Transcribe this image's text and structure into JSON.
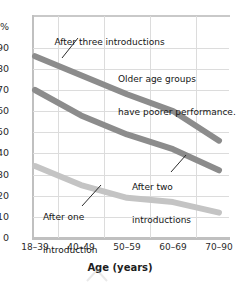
{
  "chart_data": {
    "type": "line",
    "title": "",
    "xlabel": "Age (years)",
    "ylabel": "",
    "categories": [
      "18–39",
      "40–49",
      "50–59",
      "60–69",
      "70–90"
    ],
    "series": [
      {
        "name": "After three introductions",
        "values": [
          86,
          77,
          68,
          60,
          46
        ],
        "color": "#8c8c8c"
      },
      {
        "name": "After two introductions",
        "values": [
          70,
          58,
          49,
          42,
          32
        ],
        "color": "#8c8c8c"
      },
      {
        "name": "After one introduction",
        "values": [
          34,
          25,
          19,
          17,
          12
        ],
        "color": "#c4c4c4"
      }
    ],
    "ylim": [
      0,
      105
    ],
    "yticks": [
      "100%",
      "90",
      "80",
      "70",
      "60",
      "50",
      "40",
      "30",
      "20",
      "10",
      "0"
    ],
    "ytick_values": [
      100,
      90,
      80,
      70,
      60,
      50,
      40,
      30,
      20,
      10,
      0
    ],
    "grid": true,
    "legend_position": "none",
    "annotations": [
      {
        "id": "three",
        "text": "After three introductions"
      },
      {
        "id": "older",
        "text": "Older age groups\nhave poorer performance."
      },
      {
        "id": "two",
        "text": "After two\nintroductions"
      },
      {
        "id": "one",
        "text": "After one\nintroduction"
      }
    ]
  },
  "axis": {
    "x_label": "Age (years)",
    "x_ticks": [
      "18–39",
      "40–49",
      "50–59",
      "60–69",
      "70–90"
    ],
    "y_ticks": [
      "100%",
      "90",
      "80",
      "70",
      "60",
      "50",
      "40",
      "30",
      "20",
      "10",
      "0"
    ]
  },
  "annotations": {
    "three": "After three introductions",
    "older_line1": "Older age groups",
    "older_line2": "have poorer performance.",
    "two_line1": "After two",
    "two_line2": "introductions",
    "one_line1": "After one",
    "one_line2": "introduction"
  },
  "colors": {
    "series_dark": "#8c8c8c",
    "series_mid": "#8c8c8c",
    "series_light": "#c4c4c4",
    "grid": "#dcdcdc",
    "axis": "#c0c0c0",
    "text": "#221f1f"
  }
}
